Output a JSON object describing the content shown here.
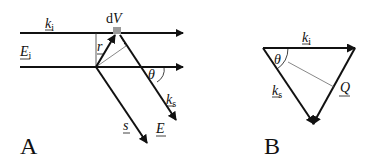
{
  "figure": {
    "panel_a": {
      "label": "A",
      "incident_wavevector": {
        "symbol": "k",
        "subscript": "i"
      },
      "incident_field": {
        "symbol": "E",
        "subscript": "i"
      },
      "volume_element": {
        "prefix": "d",
        "symbol": "V"
      },
      "position_vector": {
        "symbol": "r"
      },
      "scattered_wavevector": {
        "symbol": "k",
        "subscript": "s"
      },
      "scattered_field": {
        "symbol": "E"
      },
      "direction_vector": {
        "symbol": "s"
      },
      "angle": "θ"
    },
    "panel_b": {
      "label": "B",
      "incident_wavevector": {
        "symbol": "k",
        "subscript": "i"
      },
      "scattered_wavevector": {
        "symbol": "k",
        "subscript": "s"
      },
      "scattering_vector": {
        "symbol": "Q"
      },
      "angle": "θ"
    },
    "colors": {
      "line": "#111111",
      "thin_line": "#555555",
      "volume_element": "#9a9a9a"
    }
  }
}
